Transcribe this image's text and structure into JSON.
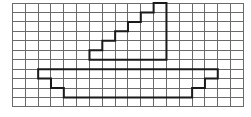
{
  "diagram": {
    "type": "grid-drawing",
    "grid": {
      "columns": 18,
      "rows": 11,
      "origin_px": [
        12.5,
        3
      ],
      "cell_width_px": 12.83,
      "cell_height_px": 9.45,
      "line_color": "#6a6a6a",
      "background": "#ffffff"
    },
    "outline_color": "#1a1a1a",
    "shapes": [
      {
        "name": "sail",
        "points": [
          [
            6,
            6
          ],
          [
            6,
            5
          ],
          [
            7,
            5
          ],
          [
            7,
            4
          ],
          [
            8,
            4
          ],
          [
            8,
            3
          ],
          [
            9,
            3
          ],
          [
            9,
            2
          ],
          [
            10,
            2
          ],
          [
            10,
            1
          ],
          [
            11,
            1
          ],
          [
            11,
            0
          ],
          [
            12,
            0
          ],
          [
            12,
            6
          ]
        ]
      },
      {
        "name": "hull",
        "points": [
          [
            2,
            7
          ],
          [
            16,
            7
          ],
          [
            16,
            8
          ],
          [
            15,
            8
          ],
          [
            15,
            9
          ],
          [
            14,
            9
          ],
          [
            14,
            10
          ],
          [
            4,
            10
          ],
          [
            4,
            9
          ],
          [
            3,
            9
          ],
          [
            3,
            8
          ],
          [
            2,
            8
          ]
        ]
      }
    ]
  }
}
